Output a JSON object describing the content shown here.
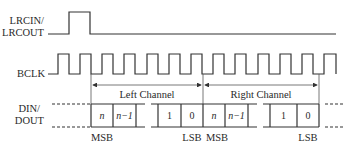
{
  "signals": {
    "lrc": {
      "label_line1": "LRCIN/",
      "label_line2": "LRCOUT"
    },
    "bclk": {
      "label": "BCLK"
    },
    "din": {
      "label_line1": "DIN/",
      "label_line2": "DOUT"
    }
  },
  "channels": {
    "left": "Left Channel",
    "right": "Right Channel"
  },
  "cells": {
    "left_n": "n",
    "left_n1": "n−1",
    "left_1": "1",
    "left_0": "0",
    "right_n": "n",
    "right_n1": "n−1",
    "right_1": "1",
    "right_0": "0"
  },
  "bit_labels": {
    "left_msb": "MSB",
    "left_lsb": "LSB",
    "right_msb": "MSB",
    "right_lsb": "LSB"
  },
  "colors": {
    "line": "#333333",
    "text": "#2a2a2a",
    "background": "#ffffff"
  }
}
